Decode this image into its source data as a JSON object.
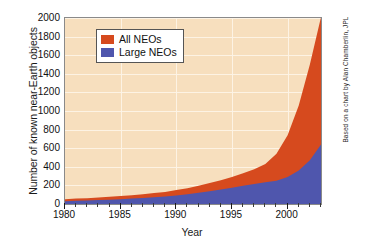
{
  "chart_data": {
    "type": "area",
    "title": "",
    "xlabel": "Year",
    "ylabel": "Number of known near-Earth objects",
    "xlim": [
      1980,
      2003
    ],
    "ylim": [
      0,
      2000
    ],
    "grid": true,
    "stacked": true,
    "legend_position": "top-left",
    "x": [
      1980,
      1981,
      1982,
      1983,
      1984,
      1985,
      1986,
      1987,
      1988,
      1989,
      1990,
      1991,
      1992,
      1993,
      1994,
      1995,
      1996,
      1997,
      1998,
      1999,
      2000,
      2001,
      2002,
      2003
    ],
    "xticks": [
      1980,
      1985,
      1990,
      1995,
      2000
    ],
    "yticks": [
      0,
      200,
      400,
      600,
      800,
      1000,
      1200,
      1400,
      1600,
      1800,
      2000
    ],
    "series": [
      {
        "name": "All NEOs",
        "color": "#d64a1e",
        "values": [
          52,
          58,
          63,
          70,
          78,
          86,
          95,
          105,
          118,
          130,
          150,
          170,
          195,
          225,
          255,
          290,
          330,
          375,
          430,
          540,
          740,
          1060,
          1500,
          2010
        ]
      },
      {
        "name": "Large NEOs",
        "color": "#4f56ad",
        "values": [
          30,
          34,
          38,
          42,
          47,
          52,
          58,
          64,
          72,
          80,
          92,
          104,
          120,
          138,
          155,
          175,
          196,
          215,
          235,
          250,
          290,
          360,
          470,
          640
        ]
      }
    ],
    "annotations": [
      "Based on a chart by Alan Chamberlin, JPL"
    ],
    "colors": {
      "plot_background": "#f7dfbe",
      "gridlines": "#fdf3e6",
      "frame": "#8a8a8a",
      "all_neos": "#d64a1e",
      "large_neos": "#4f56ad",
      "figure_background": "#ffffff"
    }
  },
  "axes": {
    "y_title": "Number of known near-Earth objects",
    "x_title": "Year",
    "y_tick_labels": [
      "2000",
      "1800",
      "1600",
      "1400",
      "1200",
      "1000",
      "800",
      "600",
      "400",
      "200",
      "0"
    ],
    "x_tick_labels": [
      "1980",
      "1985",
      "1990",
      "1995",
      "2000"
    ]
  },
  "legend": {
    "items": [
      {
        "label": "All NEOs",
        "color": "#d64a1e"
      },
      {
        "label": "Large NEOs",
        "color": "#4f56ad"
      }
    ]
  },
  "credit": {
    "text": "Based on a chart by Alan Chamberlin, JPL"
  }
}
